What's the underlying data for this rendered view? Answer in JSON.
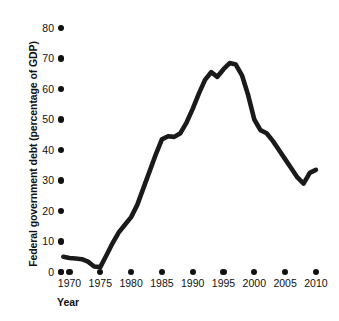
{
  "chart_data": {
    "type": "line",
    "title": "",
    "xlabel": "Year",
    "ylabel": "Federal government debt (percentage of GDP)",
    "xlim": [
      1968,
      2011
    ],
    "ylim": [
      0,
      80
    ],
    "grid": false,
    "legend": null,
    "line_color": "#1a1a1a",
    "x_ticks": [
      1970,
      1975,
      1980,
      1985,
      1990,
      1995,
      2000,
      2005,
      2010
    ],
    "x_tick_labels": [
      "1970",
      "1975",
      "1980",
      "1985",
      "1990",
      "1995",
      "2000",
      "2005",
      "2010"
    ],
    "y_ticks": [
      0,
      10,
      20,
      30,
      40,
      50,
      60,
      70,
      80
    ],
    "y_tick_labels": [
      "0",
      "10",
      "20",
      "30",
      "40",
      "50",
      "60",
      "70",
      "80"
    ],
    "x": [
      1969,
      1970,
      1971,
      1972,
      1973,
      1974,
      1975,
      1976,
      1977,
      1978,
      1979,
      1980,
      1981,
      1982,
      1983,
      1984,
      1985,
      1986,
      1987,
      1988,
      1989,
      1990,
      1991,
      1992,
      1993,
      1994,
      1995,
      1996,
      1997,
      1998,
      1999,
      2000,
      2001,
      2002,
      2003,
      2004,
      2005,
      2006,
      2007,
      2008,
      2009,
      2010
    ],
    "y": [
      5.0,
      4.6,
      4.4,
      4.2,
      3.4,
      1.8,
      1.6,
      5.5,
      9.5,
      13.0,
      15.5,
      18.0,
      22.0,
      27.5,
      33.0,
      38.5,
      43.5,
      44.5,
      44.3,
      45.5,
      49.0,
      53.5,
      58.5,
      63.0,
      65.5,
      64.0,
      66.5,
      68.5,
      68.0,
      64.5,
      58.0,
      50.0,
      46.5,
      45.5,
      43.0,
      40.0,
      37.0,
      34.0,
      31.0,
      29.0,
      32.5,
      33.5
    ]
  },
  "axes": {
    "origin_marker": "origin-dot"
  }
}
